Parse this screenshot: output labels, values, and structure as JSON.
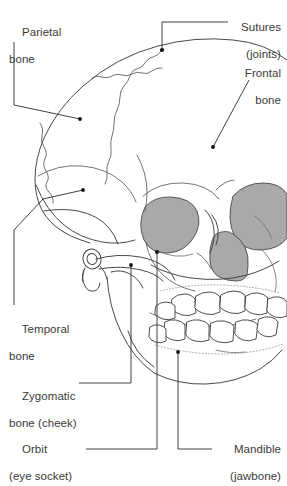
{
  "figure": {
    "background_color": "#ffffff",
    "outline_color": "#3f3f3f",
    "detail_color": "#6b6b6b",
    "shaded_color": "#a9a9a9",
    "leader_color": "#2b2b2b",
    "text_color": "#3a3a3a"
  },
  "labels": [
    {
      "id": "parietal",
      "name": "parietal-bone",
      "line1": "Parietal",
      "line2": "bone",
      "align": "left"
    },
    {
      "id": "sutures",
      "name": "sutures-joints",
      "line1": "Sutures",
      "line2": "(joints)",
      "align": "right"
    },
    {
      "id": "frontal",
      "name": "frontal-bone",
      "line1": "Frontal",
      "line2": "bone",
      "align": "right"
    },
    {
      "id": "temporal",
      "name": "temporal-bone",
      "line1": "Temporal",
      "line2": "bone",
      "align": "left"
    },
    {
      "id": "zygomatic",
      "name": "zygomatic-bone-cheek",
      "line1": "Zygomatic",
      "line2": "bone (cheek)",
      "align": "left"
    },
    {
      "id": "orbit",
      "name": "orbit-eye-socket",
      "line1": "Orbit",
      "line2": "(eye socket)",
      "align": "left"
    },
    {
      "id": "mandible",
      "name": "mandible-jawbone",
      "line1": "Mandible",
      "line2": "(jawbone)",
      "align": "right"
    }
  ],
  "anatomy_parts": [
    {
      "name": "cranium-vault",
      "shaded": false
    },
    {
      "name": "parietal-bone-region",
      "shaded": false
    },
    {
      "name": "frontal-bone-region",
      "shaded": false
    },
    {
      "name": "temporal-bone-region",
      "shaded": false
    },
    {
      "name": "left-orbit",
      "shaded": true
    },
    {
      "name": "right-orbit",
      "shaded": true
    },
    {
      "name": "nasal-cavity",
      "shaded": true
    },
    {
      "name": "zygomatic-arch",
      "shaded": false
    },
    {
      "name": "maxilla-upper-teeth",
      "shaded": false
    },
    {
      "name": "mandible-lower-teeth",
      "shaded": false
    },
    {
      "name": "coronal-suture",
      "shaded": false
    },
    {
      "name": "squamous-suture",
      "shaded": false
    },
    {
      "name": "external-auditory-meatus",
      "shaded": false
    }
  ]
}
